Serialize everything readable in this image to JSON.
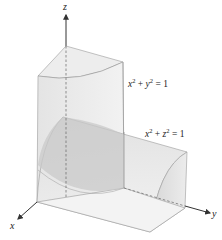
{
  "figure": {
    "axes": {
      "x_label": "x",
      "y_label": "y",
      "z_label": "z"
    },
    "surfaces": [
      {
        "name": "vertical-cylinder",
        "var1": "x",
        "var2": "y",
        "exp": "2",
        "plus": "+",
        "equals": "=",
        "rhs": "1"
      },
      {
        "name": "horizontal-cylinder",
        "var1": "x",
        "var2": "z",
        "exp": "2",
        "plus": "+",
        "equals": "=",
        "rhs": "1"
      }
    ],
    "colors": {
      "light_face": "#eeeeee",
      "mid_face": "#e2e2e2",
      "side_face": "#d8d8d8",
      "intersection": "#c4c4c4",
      "edge": "#9a9a9a",
      "axis": "#333333"
    }
  }
}
